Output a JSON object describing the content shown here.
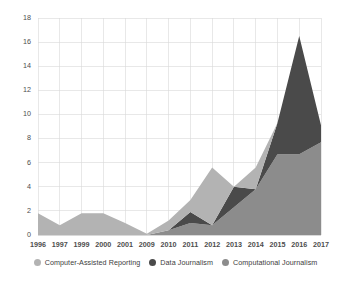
{
  "chart_data": {
    "type": "area",
    "stacked": true,
    "title": "",
    "subtitle": "",
    "xlabel": "",
    "ylabel": "",
    "ylim": [
      0,
      18
    ],
    "ytick_step": 2,
    "yticks": [
      0,
      2,
      4,
      6,
      8,
      10,
      12,
      14,
      16,
      18
    ],
    "grid": true,
    "legend_position": "bottom",
    "categories": [
      "1996",
      "1997",
      "1999",
      "2000",
      "2001",
      "2009",
      "2010",
      "2011",
      "2012",
      "2013",
      "2014",
      "2015",
      "2016",
      "2017"
    ],
    "series": [
      {
        "name": "Computational Journalism",
        "color": "#8c8c8c",
        "values": [
          0,
          0,
          0,
          0,
          0,
          0,
          0.4,
          1.0,
          0.8,
          2.3,
          3.8,
          6.7,
          6.7,
          7.7
        ]
      },
      {
        "name": "Data Journalism",
        "color": "#4a4a4a",
        "values": [
          0,
          0,
          0,
          0,
          0,
          0,
          0,
          0.9,
          0,
          1.7,
          0,
          2.6,
          9.8,
          1.4
        ]
      },
      {
        "name": "Computer-Assisted Reporting",
        "color": "#b3b3b3",
        "values": [
          1.8,
          0.8,
          1.8,
          1.8,
          1.0,
          0.1,
          0.8,
          1.0,
          4.8,
          0,
          1.8,
          0,
          0,
          0
        ]
      }
    ],
    "stacked_totals": [
      1.8,
      0.8,
      1.8,
      1.8,
      1.0,
      0.1,
      1.2,
      2.9,
      5.6,
      4.0,
      5.6,
      9.3,
      16.5,
      9.1
    ],
    "peak": {
      "category": "2016",
      "value": 16.5,
      "series": "Data Journalism"
    }
  },
  "legend": {
    "items": [
      {
        "label": "Computer-Assisted Reporting",
        "color": "#b3b3b3"
      },
      {
        "label": "Data Journalism",
        "color": "#4a4a4a"
      },
      {
        "label": "Computational Journalism",
        "color": "#8c8c8c"
      }
    ]
  },
  "axis": {
    "y_tick_labels": [
      "18",
      "16",
      "14",
      "12",
      "10",
      "8",
      "6",
      "4",
      "2",
      "0"
    ],
    "x_tick_labels": [
      "1996",
      "1997",
      "1999",
      "2000",
      "2001",
      "2009",
      "2010",
      "2011",
      "2012",
      "2013",
      "2014",
      "2015",
      "2016",
      "2017"
    ]
  }
}
